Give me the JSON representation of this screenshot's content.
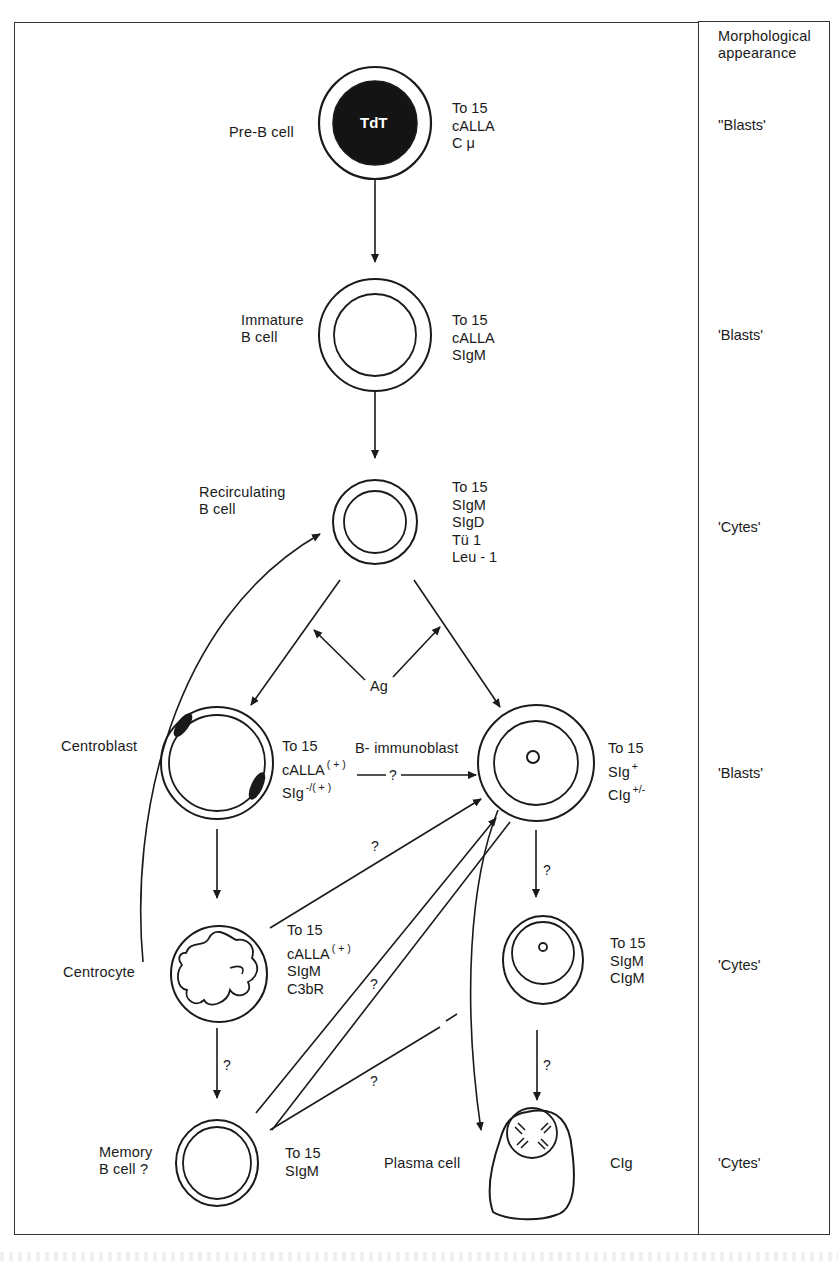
{
  "header": {
    "column_title": "Morphological\nappearance"
  },
  "cells": [
    {
      "id": "pre-b",
      "name": "Pre-B cell",
      "nucleus_label": "TdT",
      "markers": [
        "To 15",
        "cALLA",
        "C μ"
      ],
      "morphology": "''Blasts'"
    },
    {
      "id": "immature-b",
      "name": "Immature\nB cell",
      "markers": [
        "To 15",
        "cALLA",
        "SIgM"
      ],
      "morphology": "'Blasts'"
    },
    {
      "id": "recirculating-b",
      "name": "Recirculating\nB cell",
      "markers": [
        "To 15",
        "SIgM",
        "SIgD",
        "Tü 1",
        "Leu - 1"
      ],
      "morphology": "'Cytes'"
    },
    {
      "id": "centroblast",
      "name": "Centroblast",
      "markers": [
        {
          "text": "To 15",
          "sup": ""
        },
        {
          "text": "cALLA",
          "sup": "( + )"
        },
        {
          "text": "SIg",
          "sup": "-/( + )"
        }
      ],
      "morphology": "'Blasts'"
    },
    {
      "id": "b-immunoblast",
      "name": "B- immunoblast",
      "markers": [
        {
          "text": "To 15",
          "sup": ""
        },
        {
          "text": "SIg",
          "sup": "+"
        },
        {
          "text": "CIg",
          "sup": "+/-"
        }
      ]
    },
    {
      "id": "centrocyte",
      "name": "Centrocyte",
      "markers": [
        {
          "text": "To 15",
          "sup": ""
        },
        {
          "text": "cALLA",
          "sup": "( + )"
        },
        {
          "text": "SIgM",
          "sup": ""
        },
        {
          "text": "C3bR",
          "sup": ""
        }
      ],
      "morphology": "'Cytes'"
    },
    {
      "id": "lymphoplasmacytoid",
      "name": "",
      "markers": [
        "To 15",
        "SIgM",
        "CIgM"
      ]
    },
    {
      "id": "memory-b",
      "name": "Memory\nB cell ?",
      "markers": [
        "To 15",
        "SIgM"
      ],
      "morphology": "'Cytes'"
    },
    {
      "id": "plasma-cell",
      "name": "Plasma cell",
      "markers": [
        "CIg"
      ]
    }
  ],
  "annotations": {
    "antigen": "Ag",
    "uncertain": "?"
  },
  "transitions": [
    {
      "from": "pre-b",
      "to": "immature-b",
      "label": ""
    },
    {
      "from": "immature-b",
      "to": "recirculating-b",
      "label": ""
    },
    {
      "from": "recirculating-b",
      "to": "centroblast",
      "label": ""
    },
    {
      "from": "recirculating-b",
      "to": "b-immunoblast",
      "label": ""
    },
    {
      "from": "centroblast",
      "to": "b-immunoblast",
      "label": "?"
    },
    {
      "from": "centroblast",
      "to": "centrocyte",
      "label": ""
    },
    {
      "from": "centrocyte",
      "to": "b-immunoblast",
      "label": "?"
    },
    {
      "from": "centrocyte",
      "to": "memory-b",
      "label": "?"
    },
    {
      "from": "centrocyte",
      "to": "recirculating-b",
      "label": ""
    },
    {
      "from": "memory-b",
      "to": "b-immunoblast",
      "label": "?"
    },
    {
      "from": "memory-b",
      "to": "b-immunoblast",
      "label": "?"
    },
    {
      "from": "b-immunoblast",
      "to": "lymphoplasmacytoid",
      "label": "?"
    },
    {
      "from": "b-immunoblast",
      "to": "plasma-cell",
      "label": ""
    },
    {
      "from": "lymphoplasmacytoid",
      "to": "plasma-cell",
      "label": "?"
    }
  ],
  "colors": {
    "ink": "#1a1a1a",
    "frame": "#333333",
    "paper": "#ffffff"
  }
}
